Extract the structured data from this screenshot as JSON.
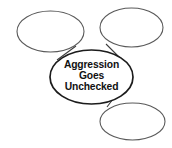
{
  "diagram": {
    "type": "concept-web",
    "background_color": "#ffffff",
    "center_node": {
      "label_lines": [
        "Aggression",
        "Goes",
        "Unchecked"
      ],
      "line1": "Aggression",
      "line2": "Goes",
      "line3": "Unchecked",
      "text_color": "#111111",
      "stroke_color": "#1c1c1c",
      "fill_color": "#ffffff"
    },
    "outer_nodes": [
      {
        "position": "top-left",
        "label": "",
        "stroke_color": "#5a5a5a",
        "fill_color": "#ffffff"
      },
      {
        "position": "top-right",
        "label": "",
        "stroke_color": "#5a5a5a",
        "fill_color": "#ffffff"
      },
      {
        "position": "bottom-right",
        "label": "",
        "stroke_color": "#5a5a5a",
        "fill_color": "#ffffff"
      }
    ],
    "connectors": [
      {
        "from": "center",
        "to": "top-left"
      },
      {
        "from": "center",
        "to": "top-right"
      },
      {
        "from": "center",
        "to": "bottom-right"
      }
    ]
  }
}
